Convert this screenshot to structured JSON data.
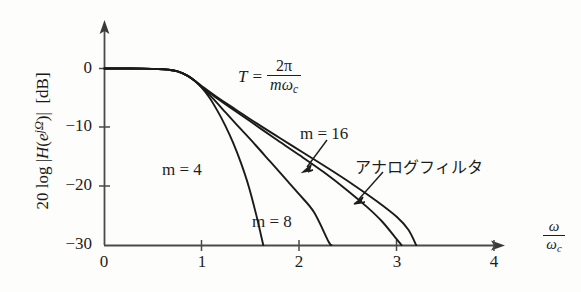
{
  "chart_data": {
    "type": "line",
    "title": "",
    "xlabel": "ω/ωc",
    "ylabel": "20 log |H(e^{jΩ})|  [dB]",
    "xlim": [
      0,
      4.3
    ],
    "ylim": [
      -30,
      3
    ],
    "grid": false,
    "legend_position": "inline-annotations",
    "xticks": [
      "0",
      "1",
      "2",
      "3",
      "4"
    ],
    "xtick_values": [
      0,
      1,
      2,
      3,
      4
    ],
    "yticks": [
      "0",
      "−10",
      "−20",
      "−30"
    ],
    "ytick_values": [
      0,
      -10,
      -20,
      -30
    ],
    "annotations": [
      {
        "id": "T-equation",
        "text": "T = 2π / (mωc)",
        "lhs": "T",
        "eq": "=",
        "numerator": "2π",
        "denominator": "mω",
        "denominator_sub": "c"
      },
      {
        "id": "analog-filter",
        "text": "アナログフィルタ"
      }
    ],
    "series": [
      {
        "name": "m = 4",
        "label": "m = 4",
        "points": [
          [
            0.0,
            0.0
          ],
          [
            0.2,
            0.0
          ],
          [
            0.4,
            -0.02
          ],
          [
            0.55,
            -0.08
          ],
          [
            0.65,
            -0.2
          ],
          [
            0.75,
            -0.5
          ],
          [
            0.85,
            -1.2
          ],
          [
            0.92,
            -2.0
          ],
          [
            1.0,
            -3.3
          ],
          [
            1.08,
            -5.0
          ],
          [
            1.16,
            -7.2
          ],
          [
            1.24,
            -9.7
          ],
          [
            1.32,
            -12.6
          ],
          [
            1.4,
            -16.0
          ],
          [
            1.48,
            -20.0
          ],
          [
            1.56,
            -25.0
          ],
          [
            1.63,
            -30.0
          ]
        ]
      },
      {
        "name": "m = 8",
        "label": "m = 8",
        "points": [
          [
            0.0,
            0.0
          ],
          [
            0.2,
            0.0
          ],
          [
            0.4,
            -0.02
          ],
          [
            0.55,
            -0.08
          ],
          [
            0.65,
            -0.2
          ],
          [
            0.75,
            -0.5
          ],
          [
            0.85,
            -1.2
          ],
          [
            0.92,
            -2.0
          ],
          [
            1.0,
            -3.2
          ],
          [
            1.12,
            -5.2
          ],
          [
            1.25,
            -7.6
          ],
          [
            1.4,
            -10.3
          ],
          [
            1.55,
            -13.0
          ],
          [
            1.7,
            -15.8
          ],
          [
            1.85,
            -18.6
          ],
          [
            2.0,
            -21.4
          ],
          [
            2.15,
            -24.4
          ],
          [
            2.3,
            -29.4
          ],
          [
            2.33,
            -30.0
          ]
        ]
      },
      {
        "name": "m = 16",
        "label": "m = 16",
        "points": [
          [
            0.0,
            0.0
          ],
          [
            0.2,
            0.0
          ],
          [
            0.4,
            -0.02
          ],
          [
            0.55,
            -0.08
          ],
          [
            0.65,
            -0.2
          ],
          [
            0.75,
            -0.5
          ],
          [
            0.85,
            -1.2
          ],
          [
            0.92,
            -2.0
          ],
          [
            1.0,
            -3.1
          ],
          [
            1.15,
            -5.0
          ],
          [
            1.35,
            -7.3
          ],
          [
            1.55,
            -9.6
          ],
          [
            1.75,
            -11.9
          ],
          [
            2.0,
            -14.7
          ],
          [
            2.25,
            -17.6
          ],
          [
            2.5,
            -20.8
          ],
          [
            2.7,
            -23.6
          ],
          [
            2.85,
            -26.0
          ],
          [
            2.98,
            -28.6
          ],
          [
            3.05,
            -30.0
          ]
        ]
      },
      {
        "name": "アナログフィルタ",
        "label": "アナログフィルタ",
        "points": [
          [
            0.0,
            0.0
          ],
          [
            0.2,
            0.0
          ],
          [
            0.4,
            -0.02
          ],
          [
            0.55,
            -0.08
          ],
          [
            0.65,
            -0.2
          ],
          [
            0.75,
            -0.5
          ],
          [
            0.85,
            -1.2
          ],
          [
            0.92,
            -2.0
          ],
          [
            1.0,
            -3.0
          ],
          [
            1.15,
            -4.8
          ],
          [
            1.35,
            -7.0
          ],
          [
            1.55,
            -9.2
          ],
          [
            1.8,
            -11.8
          ],
          [
            2.05,
            -14.4
          ],
          [
            2.3,
            -17.0
          ],
          [
            2.55,
            -19.7
          ],
          [
            2.8,
            -22.6
          ],
          [
            3.0,
            -25.2
          ],
          [
            3.12,
            -27.4
          ],
          [
            3.2,
            -30.0
          ]
        ]
      }
    ],
    "colors": {
      "curve": "#1a1a1a",
      "axis": "#4a4a4a",
      "text": "#1d1d1d",
      "background": "#fdfdfc"
    }
  },
  "axis": {
    "y_title_parts": {
      "prefix": "20 log",
      "abs_open": "|",
      "h": "H",
      "paren_open": "(",
      "e": "e",
      "exponent": "jΩ",
      "paren_close": ")",
      "abs_close": "|",
      "unit": "[dB]"
    },
    "x_title": {
      "numerator": "ω",
      "denominator": "ω",
      "denominator_sub": "c"
    }
  },
  "labels": {
    "m4": "m = 4",
    "m8": "m = 8",
    "m16": "m = 16",
    "analog": "アナログフィルタ",
    "xtick0": "0",
    "xtick1": "1",
    "xtick2": "2",
    "xtick3": "3",
    "xtick4": "4",
    "ytick0": "0",
    "ytick1": "−10",
    "ytick2": "−20",
    "ytick3": "−30"
  },
  "equation": {
    "lhs": "T",
    "equals": "=",
    "numerator": "2π",
    "den_m": "m",
    "den_omega": "ω",
    "den_sub": "c"
  }
}
